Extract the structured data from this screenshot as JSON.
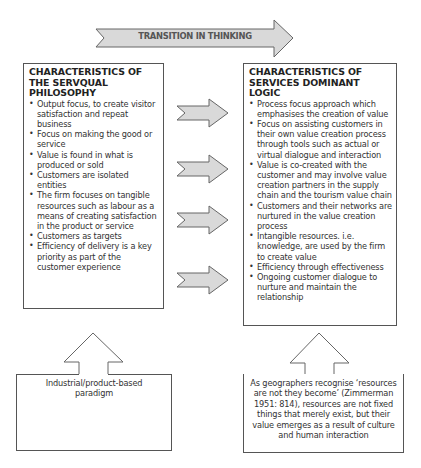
{
  "header": {
    "transition_label": "TRANSITION IN THINKING"
  },
  "left_box": {
    "title": "CHARACTERISTICS OF THE SERVQUAL PHILOSOPHY",
    "items": [
      "Output focus, to create visitor satisfaction and repeat business",
      "Focus on making the good or service",
      "Value is found in what is produced or sold",
      "Customers are isolated entities",
      "The firm focuses on tangible resources such as labour as a means of creating satisfaction in the product or service",
      "Customers as targets",
      "Efficiency of delivery is a key priority as part of the customer experience"
    ]
  },
  "right_box": {
    "title": "CHARACTERISTICS OF SERVICES DOMINANT LOGIC",
    "items": [
      "Process focus approach which emphasises the creation of value",
      "Focus on assisting customers in their own value creation process through tools such as actual or virtual dialogue and interaction",
      "Value is co-created with the customer and may involve value creation partners in the supply chain and the tourism value chain",
      "Customers and their networks are nurtured in the value creation process",
      "Intangible resources. i.e. knowledge, are used by the firm to create value",
      "Efficiency through effectiveness",
      "Ongoing customer dialogue to nurture and maintain the relationship"
    ]
  },
  "bottom_left": {
    "text": "Industrial/product-based paradigm"
  },
  "bottom_right": {
    "text": "As geographers recognise ‘resources are not they become’ (Zimmerman 1951: 814), resources are not fixed things that merely exist, but their value emerges as a result of culture and human interaction"
  },
  "colors": {
    "arrow_fill": "#d9d9d9",
    "outline": "#555555"
  }
}
